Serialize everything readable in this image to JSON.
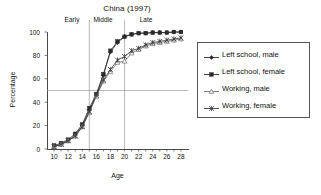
{
  "chart_data": {
    "type": "line",
    "title": "China (1997)",
    "xlabel": "Age",
    "ylabel": "Percentage",
    "xlim": [
      9,
      29
    ],
    "ylim": [
      0,
      100
    ],
    "xticks": [
      10,
      11,
      12,
      13,
      14,
      15,
      16,
      17,
      18,
      19,
      20,
      21,
      22,
      23,
      24,
      25,
      26,
      27,
      28
    ],
    "xtick_labels": [
      10,
      12,
      14,
      16,
      18,
      20,
      22,
      24,
      26,
      28
    ],
    "yticks": [
      0,
      20,
      40,
      60,
      80,
      100
    ],
    "grid": false,
    "reference_lines": {
      "horizontal": [
        50
      ],
      "vertical": [
        15,
        20
      ]
    },
    "annotations": [
      {
        "text": "Early",
        "x": 12.5
      },
      {
        "text": "Middle",
        "x": 17.5
      },
      {
        "text": "Late",
        "x": 24.0
      }
    ],
    "legend_position": "right",
    "x": [
      10,
      11,
      12,
      13,
      14,
      15,
      16,
      17,
      18,
      19,
      20,
      21,
      22,
      23,
      24,
      25,
      26,
      27,
      28
    ],
    "series": [
      {
        "name": "Left school, male",
        "marker": "filled-diamond",
        "color": "#2b2b2b",
        "values": [
          2,
          4,
          7,
          12,
          20,
          33,
          46,
          63,
          83,
          91,
          96,
          98,
          99,
          99,
          99.5,
          99.5,
          99.5,
          100,
          100
        ]
      },
      {
        "name": "Left school, female",
        "marker": "filled-square",
        "color": "#2b2b2b",
        "values": [
          3,
          5,
          8,
          13,
          21,
          35,
          47,
          64,
          84,
          92,
          96,
          98,
          99,
          99,
          99.5,
          99.5,
          99.5,
          100,
          100
        ]
      },
      {
        "name": "Working, male",
        "marker": "open-triangle",
        "color": "#6e6e6e",
        "values": [
          2,
          4,
          7,
          11,
          19,
          31,
          45,
          58,
          66,
          74,
          75,
          82,
          85,
          88,
          90,
          91,
          92,
          93,
          94
        ]
      },
      {
        "name": "Working, female",
        "marker": "star-x",
        "color": "#3a3a3a",
        "values": [
          2,
          4,
          7,
          11,
          19,
          32,
          46,
          59,
          68,
          76,
          79,
          84,
          86,
          89,
          91,
          92,
          93,
          94,
          95
        ]
      }
    ]
  }
}
